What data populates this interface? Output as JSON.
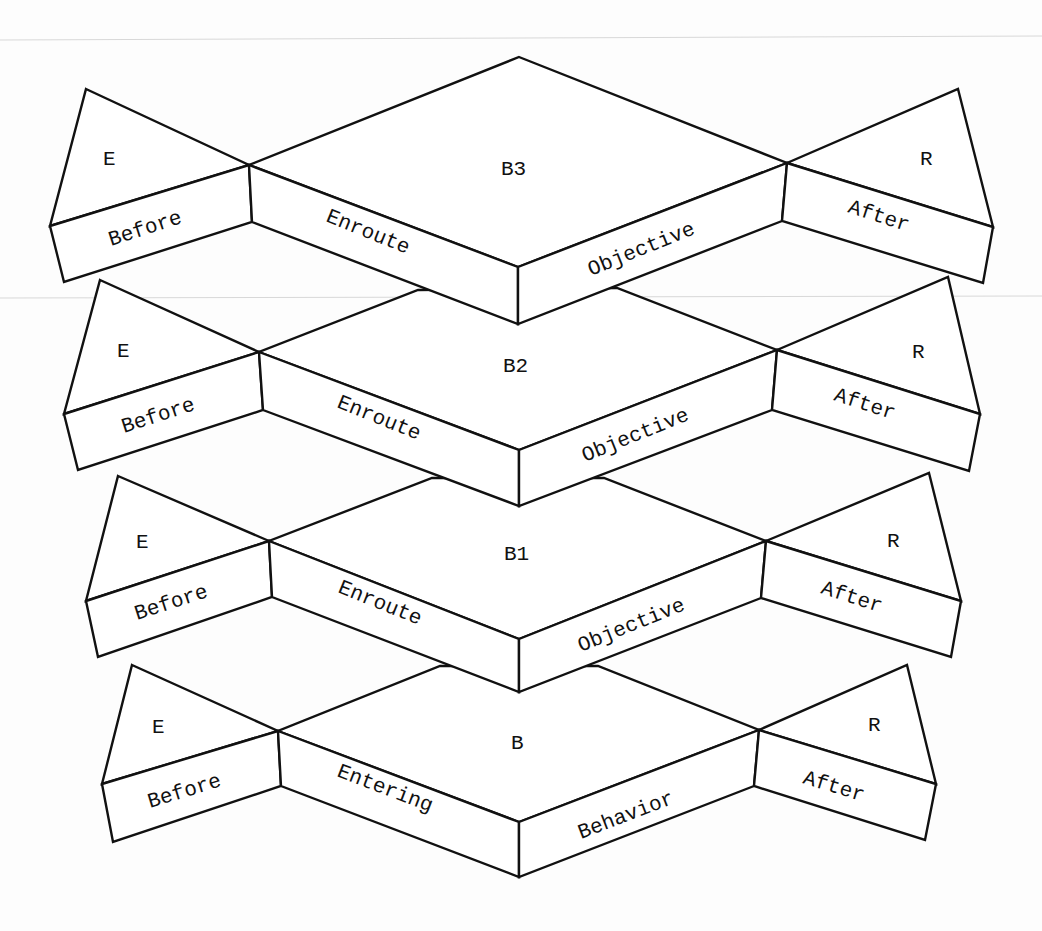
{
  "diagram": {
    "tiers": [
      {
        "id": "B3",
        "top": {
          "left": "E",
          "center": "B3",
          "right": "R"
        },
        "faces": {
          "left": "Before",
          "center_left": "Enroute",
          "center_right": "Objective",
          "right": "After"
        }
      },
      {
        "id": "B2",
        "top": {
          "left": "E",
          "center": "B2",
          "right": "R"
        },
        "faces": {
          "left": "Before",
          "center_left": "Enroute",
          "center_right": "Objective",
          "right": "After"
        }
      },
      {
        "id": "B1",
        "top": {
          "left": "E",
          "center": "B1",
          "right": "R"
        },
        "faces": {
          "left": "Before",
          "center_left": "Enroute",
          "center_right": "Objective",
          "right": "After"
        }
      },
      {
        "id": "B",
        "top": {
          "left": "E",
          "center": "B",
          "right": "R"
        },
        "faces": {
          "left": "Before",
          "center_left": "Entering",
          "center_right": "Behavior",
          "right": "After"
        }
      }
    ]
  }
}
